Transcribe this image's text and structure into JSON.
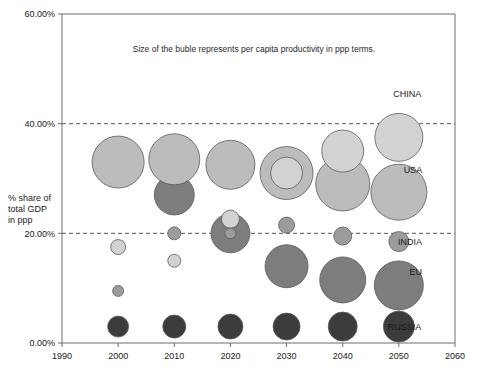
{
  "chart_data": {
    "type": "scatter",
    "subtype": "bubble",
    "title": "",
    "annotation": "Size of the buble represents per capita productivity in ppp terms.",
    "xlabel": "",
    "ylabel": "% share of total GDP in ppp",
    "ylabel_lines": [
      "% share of",
      "total GDP",
      "in ppp"
    ],
    "xlim": [
      1990,
      2060
    ],
    "ylim": [
      0,
      60
    ],
    "x_ticks": [
      1990,
      2000,
      2010,
      2020,
      2030,
      2040,
      2050,
      2060
    ],
    "x_tick_labels": [
      "1990",
      "2000",
      "2010",
      "2020",
      "2030",
      "2040",
      "2050",
      "2060"
    ],
    "y_ticks": [
      0,
      20,
      40,
      60
    ],
    "y_tick_labels": [
      "0.00%",
      "20.00%",
      "40.00%",
      "60.00%"
    ],
    "grid": "dashed horizontal gridlines at 20% and 40%",
    "legend": "right-edge series labels",
    "colors": {
      "china": "#d2d2d2",
      "usa": "#bcbcbc",
      "india": "#9c9c9c",
      "eu": "#7d7d7d",
      "russia": "#3c3c3c",
      "bubble_stroke": "#5a5a5a",
      "axis": "#6d6d6d",
      "gridline": "#555555",
      "text": "#1a1a1a"
    },
    "series": [
      {
        "name": "CHINA",
        "color": "#d2d2d2",
        "label_x": 2051.5,
        "label_y": 45.5,
        "points": [
          {
            "x": 2000,
            "y": 17.5,
            "r": 7.5
          },
          {
            "x": 2010,
            "y": 15.0,
            "r": 6.5
          },
          {
            "x": 2020,
            "y": 22.6,
            "r": 9.0
          },
          {
            "x": 2030,
            "y": 31.0,
            "r": 16.0
          },
          {
            "x": 2040,
            "y": 35.0,
            "r": 21.0
          },
          {
            "x": 2050,
            "y": 37.5,
            "r": 24.0
          }
        ]
      },
      {
        "name": "USA",
        "color": "#bcbcbc",
        "label_x": 2052.5,
        "label_y": 31.5,
        "points": [
          {
            "x": 2000,
            "y": 33.0,
            "r": 26.0
          },
          {
            "x": 2010,
            "y": 33.5,
            "r": 25.5
          },
          {
            "x": 2020,
            "y": 32.5,
            "r": 24.5
          },
          {
            "x": 2030,
            "y": 31.0,
            "r": 26.5
          },
          {
            "x": 2040,
            "y": 29.0,
            "r": 27.0
          },
          {
            "x": 2050,
            "y": 27.5,
            "r": 28.0
          }
        ]
      },
      {
        "name": "INDIA",
        "color": "#9c9c9c",
        "label_x": 2052.0,
        "label_y": 18.5,
        "points": [
          {
            "x": 2000,
            "y": 9.5,
            "r": 5.5
          },
          {
            "x": 2010,
            "y": 20.0,
            "r": 6.5
          },
          {
            "x": 2020,
            "y": 20.0,
            "r": 5.5
          },
          {
            "x": 2030,
            "y": 21.5,
            "r": 8.0
          },
          {
            "x": 2040,
            "y": 19.5,
            "r": 9.0
          },
          {
            "x": 2050,
            "y": 18.5,
            "r": 10.0
          }
        ]
      },
      {
        "name": "EU",
        "color": "#7d7d7d",
        "label_x": 2053.0,
        "label_y": 13.0,
        "points": [
          {
            "x": 2010,
            "y": 27.0,
            "r": 20.0
          },
          {
            "x": 2020,
            "y": 20.0,
            "r": 19.5
          },
          {
            "x": 2030,
            "y": 14.0,
            "r": 21.5
          },
          {
            "x": 2040,
            "y": 11.5,
            "r": 23.0
          },
          {
            "x": 2050,
            "y": 10.5,
            "r": 24.5
          }
        ]
      },
      {
        "name": "RUSSIA",
        "color": "#3c3c3c",
        "label_x": 2051.0,
        "label_y": 3.0,
        "points": [
          {
            "x": 2000,
            "y": 3.0,
            "r": 10.5
          },
          {
            "x": 2010,
            "y": 3.0,
            "r": 11.5
          },
          {
            "x": 2020,
            "y": 3.0,
            "r": 12.5
          },
          {
            "x": 2030,
            "y": 3.0,
            "r": 13.5
          },
          {
            "x": 2040,
            "y": 3.0,
            "r": 14.5
          },
          {
            "x": 2050,
            "y": 3.0,
            "r": 15.5
          }
        ]
      }
    ]
  }
}
